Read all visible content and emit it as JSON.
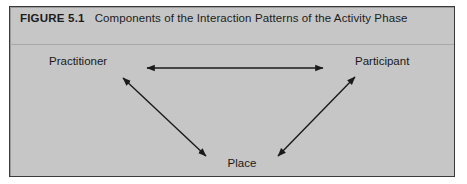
{
  "figure": {
    "label": "FIGURE 5.1",
    "title": "Components of the Interaction Patterns of the Activity Phase",
    "background_color": "#c6c6c6",
    "border_color": "#3a3a3a",
    "text_color": "#1a1a1a"
  },
  "diagram": {
    "type": "triangle-relationship",
    "nodes": [
      {
        "id": "practitioner",
        "label": "Practitioner",
        "x": 80,
        "y": 55
      },
      {
        "id": "participant",
        "label": "Participant",
        "x": 378,
        "y": 55
      },
      {
        "id": "place",
        "label": "Place",
        "x": 232,
        "y": 157
      }
    ],
    "connections": [
      {
        "from": "practitioner",
        "to": "participant",
        "style": "double-headed-arrow",
        "orientation": "horizontal",
        "x1": 137,
        "y1": 61,
        "x2": 313,
        "y2": 61
      },
      {
        "from": "practitioner",
        "to": "place",
        "style": "double-headed-arrow",
        "orientation": "diagonal-down-right",
        "x1": 113,
        "y1": 71,
        "x2": 196,
        "y2": 149
      },
      {
        "from": "place",
        "to": "participant",
        "style": "double-headed-arrow",
        "orientation": "diagonal-up-right",
        "x1": 268,
        "y1": 149,
        "x2": 345,
        "y2": 70
      }
    ],
    "arrow_color": "#1a1a1a"
  }
}
